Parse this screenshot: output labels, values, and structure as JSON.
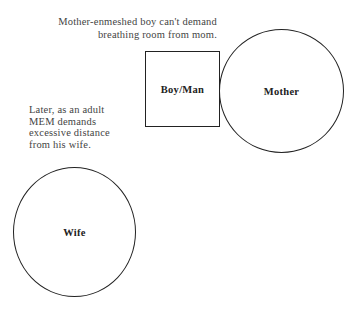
{
  "captions": {
    "top": {
      "lines": [
        "Mother-enmeshed boy can't demand",
        "breathing room from mom."
      ]
    },
    "left": {
      "lines": [
        "Later, as an adult",
        "MEM demands",
        "excessive distance",
        "from his wife."
      ]
    }
  },
  "shapes": {
    "boy_man": {
      "label": "Boy/Man",
      "shape": "square"
    },
    "mother": {
      "label": "Mother",
      "shape": "circle"
    },
    "wife": {
      "label": "Wife",
      "shape": "circle"
    }
  },
  "colors": {
    "stroke": "#222222",
    "text": "#444444",
    "background": "#ffffff"
  }
}
